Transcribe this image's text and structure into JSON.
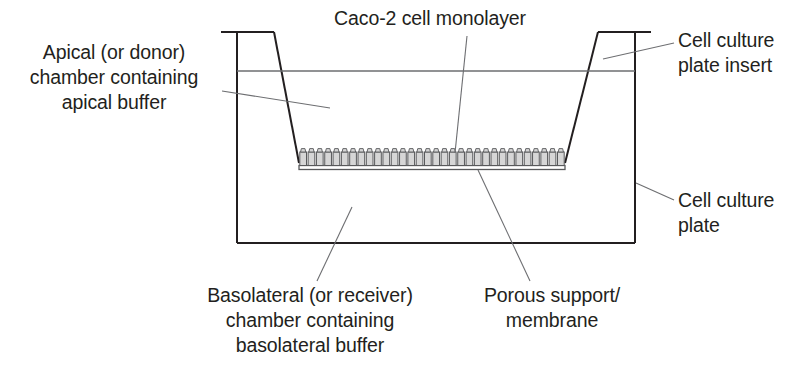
{
  "figure": {
    "width": 805,
    "height": 369,
    "background_color": "#ffffff"
  },
  "labels": {
    "apical_chamber": "Apical (or donor)\nchamber containing\napical buffer",
    "caco2_monolayer": "Caco-2 cell monolayer",
    "cell_culture_plate_insert": "Cell culture\nplate insert",
    "cell_culture_plate": "Cell culture\nplate",
    "basolateral_chamber": "Basolateral (or receiver)\nchamber containing\nbasolateral buffer",
    "porous_support": "Porous support/\nmembrane"
  },
  "colors": {
    "outline": "#231f20",
    "leader_line": "#6d6e71",
    "fluid_level_line": "#6d6e71",
    "cell_fill": "#d6d6d6",
    "cell_stroke": "#58595b",
    "membrane_fill": "#ffffff",
    "text": "#231f20"
  },
  "geometry": {
    "plate": {
      "left_wall_x": 237,
      "right_wall_x": 635,
      "top_y": 32,
      "bottom_y": 243,
      "rim_left_x": 221,
      "rim_right_x": 651
    },
    "insert": {
      "top_left_x": 274,
      "top_right_x": 598,
      "top_y": 32,
      "bottom_left_x": 299,
      "bottom_right_x": 565,
      "bottom_y": 162
    },
    "fluid_level_y": 71,
    "membrane": {
      "x1": 299,
      "x2": 565,
      "y_top": 152,
      "y_bottom": 168,
      "cell_count": 32
    }
  },
  "leaders": [
    {
      "name": "apical-chamber-leader",
      "x1": 222,
      "y1": 91,
      "x2": 330,
      "y2": 108
    },
    {
      "name": "caco2-monolayer-leader",
      "x1": 467,
      "y1": 36,
      "x2": 455,
      "y2": 153
    },
    {
      "name": "insert-leader",
      "x1": 674,
      "y1": 43,
      "x2": 603,
      "y2": 59
    },
    {
      "name": "plate-leader",
      "x1": 674,
      "y1": 200,
      "x2": 636,
      "y2": 183
    },
    {
      "name": "basolateral-chamber-leader",
      "x1": 317,
      "y1": 281,
      "x2": 352,
      "y2": 207
    },
    {
      "name": "porous-support-leader",
      "x1": 530,
      "y1": 281,
      "x2": 478,
      "y2": 170
    }
  ]
}
